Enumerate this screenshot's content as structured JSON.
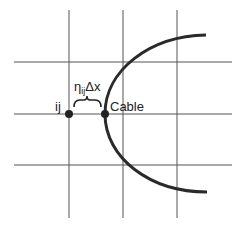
{
  "diagram": {
    "labels": {
      "node": "ij",
      "cable": "Cable",
      "eta": "η",
      "eta_sub": "ij",
      "delta_x": "Δx"
    },
    "grid": {
      "vertical_x": [
        69,
        123,
        177
      ],
      "horizontal_y": [
        62,
        114,
        165
      ],
      "color": "#555555"
    },
    "colors": {
      "curve": "#2a2a2a",
      "dot": "#222222",
      "text": "#222222"
    }
  }
}
